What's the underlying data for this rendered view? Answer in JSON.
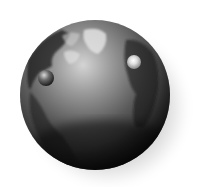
{
  "image": {
    "subject": "globe",
    "style": "grayscale 3D rendered illustration",
    "background": "#ffffff",
    "globe": {
      "cx": 95,
      "cy": 95,
      "r": 75,
      "base_color": "#3a3a3a",
      "highlight_color": "#cfcfcf",
      "shadow_color": "#0a0a0a"
    },
    "markers": [
      {
        "name": "left-sphere",
        "cx": 46,
        "cy": 78,
        "r": 8
      },
      {
        "name": "right-sphere",
        "cx": 134,
        "cy": 62,
        "r": 7
      }
    ]
  }
}
